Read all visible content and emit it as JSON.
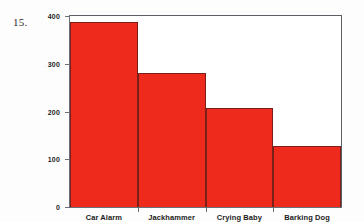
{
  "problem_number": "15.",
  "chart_data": {
    "type": "bar",
    "title": "",
    "xlabel": "",
    "ylabel": "Frequency",
    "categories": [
      "Car Alarm",
      "Jackhammer",
      "Crying Baby",
      "Barking Dog"
    ],
    "values": [
      388,
      280,
      208,
      128
    ],
    "ylim": [
      0,
      400
    ],
    "yticks": [
      0,
      100,
      200,
      300,
      400
    ],
    "ytick_labels": [
      "0",
      "100",
      "200",
      "300",
      "400"
    ],
    "grid": false,
    "legend": null,
    "bar_color": "#ed2a1b",
    "bar_edge_color": "#7a2019",
    "axis_color": "#6b7076",
    "background_color": "#ffffff"
  }
}
